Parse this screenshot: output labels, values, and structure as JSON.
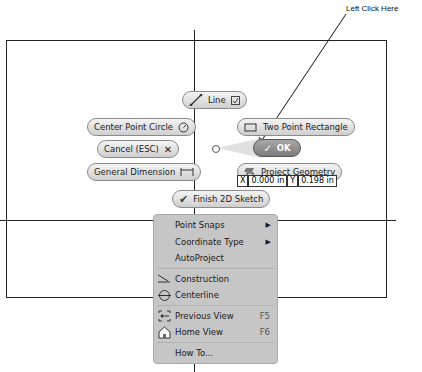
{
  "annotation": {
    "label": "Left Click Here"
  },
  "marking_menu": {
    "line": {
      "label": "Line"
    },
    "center_point_circle": {
      "label": "Center Point Circle"
    },
    "two_point_rectangle": {
      "label": "Two Point Rectangle"
    },
    "cancel": {
      "label": "Cancel (ESC)"
    },
    "ok": {
      "label": "OK"
    },
    "general_dimension": {
      "label": "General Dimension"
    },
    "project_geometry": {
      "label": "Project Geometry"
    },
    "finish_sketch": {
      "label": "Finish 2D Sketch"
    }
  },
  "coordinates": {
    "x_label": "X",
    "x_value": "0.000 in",
    "y_label": "Y",
    "y_value": "0.198 in"
  },
  "context_menu": {
    "items": [
      {
        "label": "Point Snaps",
        "submenu": true
      },
      {
        "label": "Coordinate Type",
        "submenu": true
      },
      {
        "label": "AutoProject"
      },
      {
        "label": "Construction",
        "icon": "construction-icon"
      },
      {
        "label": "Centerline",
        "icon": "centerline-icon"
      },
      {
        "label": "Previous View",
        "shortcut": "F5",
        "icon": "previous-view-icon"
      },
      {
        "label": "Home View",
        "shortcut": "F6",
        "icon": "home-view-icon"
      },
      {
        "label": "How To..."
      }
    ]
  }
}
